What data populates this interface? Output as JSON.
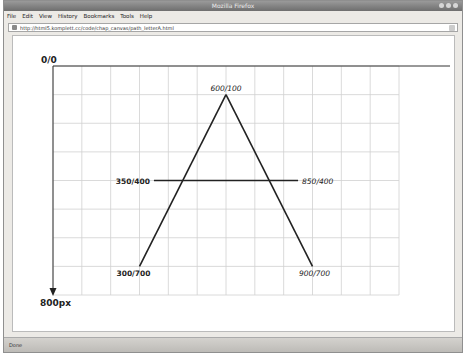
{
  "window": {
    "title": "Mozilla Firefox"
  },
  "menubar": {
    "items": [
      "File",
      "Edit",
      "View",
      "History",
      "Bookmarks",
      "Tools",
      "Help"
    ]
  },
  "urlbar": {
    "url": "http://html5.komplett.cc/code/chap_canvas/path_letterA.html"
  },
  "canvas": {
    "origin_label": "0/0",
    "x_axis_label": "1200px",
    "y_axis_label": "800px",
    "grid": {
      "width_units": 1200,
      "height_units": 800,
      "cell_units": 100,
      "color": "#d0d0d0"
    },
    "points": [
      {
        "label": "600/100",
        "x": 600,
        "y": 100,
        "style": "italic"
      },
      {
        "label": "300/700",
        "x": 300,
        "y": 700,
        "style": "bold"
      },
      {
        "label": "900/700",
        "x": 900,
        "y": 700,
        "style": "italic"
      },
      {
        "label": "350/400",
        "x": 350,
        "y": 400,
        "style": "bold"
      },
      {
        "label": "850/400",
        "x": 850,
        "y": 400,
        "style": "italic"
      }
    ],
    "line_color": "#222222"
  },
  "statusbar": {
    "text": "Done"
  }
}
